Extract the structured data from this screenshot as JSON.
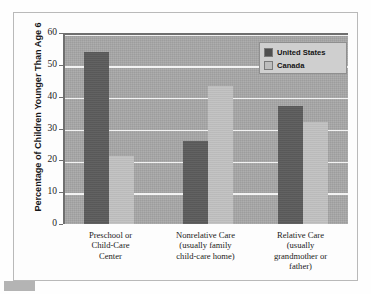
{
  "chart_data": {
    "type": "bar",
    "title": "",
    "xlabel": "",
    "ylabel": "Percentage of Children Younger Than Age 6",
    "ylim": [
      0,
      60
    ],
    "yticks": [
      0,
      10,
      20,
      30,
      40,
      50,
      60
    ],
    "grid": true,
    "legend_position": "top-right",
    "categories": [
      "Preschool or Child-Care Center",
      "Nonrelative Care (usually family child-care home)",
      "Relative Care (usually grandmother or father)"
    ],
    "category_lines": [
      [
        "Preschool or",
        "Child-Care",
        "Center"
      ],
      [
        "Nonrelative Care",
        "(usually family",
        "child-care home)"
      ],
      [
        "Relative Care",
        "(usually",
        "grandmother or",
        "father)"
      ]
    ],
    "series": [
      {
        "name": "United States",
        "color": "#5c5c5c",
        "values": [
          54,
          26,
          37
        ]
      },
      {
        "name": "Canada",
        "color": "#c2c2c2",
        "values": [
          21.5,
          43.5,
          32
        ]
      }
    ]
  },
  "legend": {
    "items": [
      {
        "label": "United States"
      },
      {
        "label": "Canada"
      }
    ]
  },
  "axis": {
    "y_title": "Percentage of Children Younger Than Age 6",
    "y_tick_labels": [
      "60",
      "50",
      "40",
      "30",
      "20",
      "10",
      "0"
    ]
  },
  "colors": {
    "united_states": "#5c5c5c",
    "canada": "#c2c2c2",
    "plot_background": "#a8a8a8",
    "gridline": "#f2f2f2",
    "frame_border": "#b9b9b9"
  }
}
